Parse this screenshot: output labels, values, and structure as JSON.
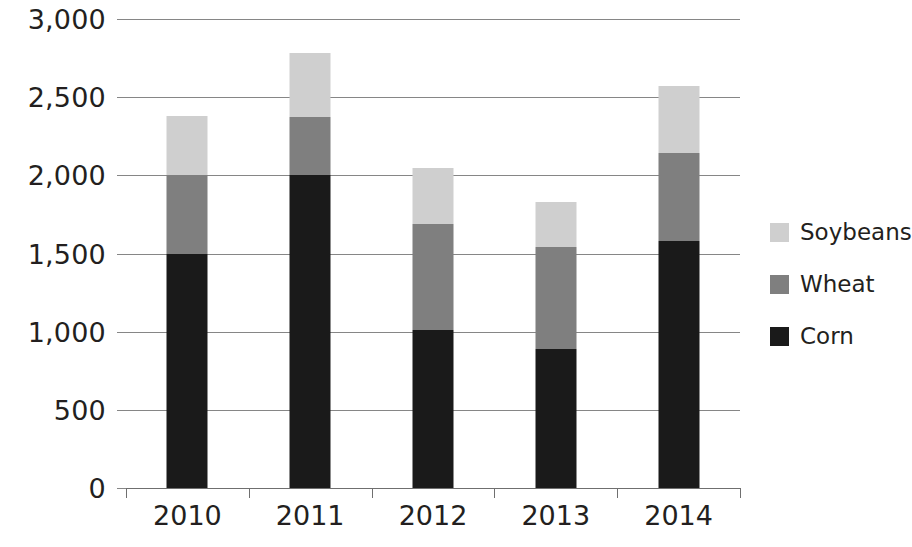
{
  "chart_data": {
    "type": "bar",
    "stacked": true,
    "title": "",
    "xlabel": "",
    "ylabel": "",
    "categories": [
      "2010",
      "2011",
      "2012",
      "2013",
      "2014"
    ],
    "series": [
      {
        "name": "Corn",
        "color": "#1a1a1a",
        "values": [
          1500,
          2000,
          1010,
          890,
          1580
        ]
      },
      {
        "name": "Wheat",
        "color": "#7f7f7f",
        "values": [
          500,
          375,
          680,
          650,
          560
        ]
      },
      {
        "name": "Soybeans",
        "color": "#cfcfcf",
        "values": [
          380,
          410,
          360,
          290,
          430
        ]
      }
    ],
    "totals": [
      2380,
      2785,
      2050,
      1830,
      2570
    ],
    "ylim": [
      0,
      3000
    ],
    "y_ticks": [
      0,
      500,
      1000,
      1500,
      2000,
      2500,
      3000
    ],
    "y_tick_labels": [
      "0",
      "500",
      "1,000",
      "1,500",
      "2,000",
      "2,500",
      "3,000"
    ],
    "grid": true,
    "legend_position": "right",
    "legend_order": [
      "Soybeans",
      "Wheat",
      "Corn"
    ]
  },
  "axes": {
    "y_tick_labels": [
      "3,000",
      "2,500",
      "2,000",
      "1,500",
      "1,000",
      "500",
      "0"
    ],
    "x_tick_labels": [
      "2010",
      "2011",
      "2012",
      "2013",
      "2014"
    ]
  },
  "legend": {
    "items": [
      {
        "label": "Soybeans",
        "color": "#cfcfcf"
      },
      {
        "label": "Wheat",
        "color": "#7f7f7f"
      },
      {
        "label": "Corn",
        "color": "#1a1a1a"
      }
    ]
  }
}
